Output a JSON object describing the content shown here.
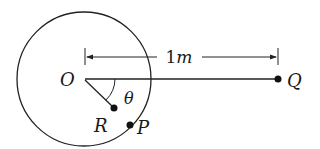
{
  "diagram": {
    "stroke_color": "#222222",
    "background": "#ffffff",
    "circle": {
      "cx": 84,
      "cy": 79,
      "r": 67
    },
    "labels": {
      "O": "O",
      "Q": "Q",
      "R": "R",
      "P": "P",
      "theta": "θ",
      "distance_num": "1",
      "distance_unit": "m"
    },
    "points": {
      "O": {
        "x": 85,
        "y": 79
      },
      "Q": {
        "x": 278,
        "y": 79
      },
      "R": {
        "x": 114,
        "y": 108
      },
      "P": {
        "x": 130,
        "y": 125
      }
    },
    "dimension": {
      "y": 57,
      "x_start": 85,
      "x_end": 278,
      "value": "1m"
    }
  }
}
